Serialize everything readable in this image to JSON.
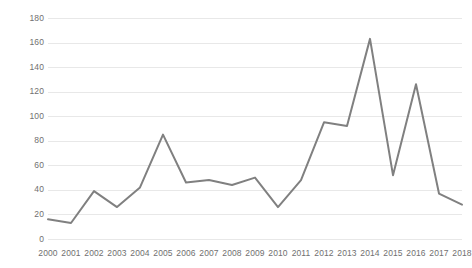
{
  "chart_data": {
    "type": "line",
    "title": "",
    "subtitle": "",
    "xlabel": "",
    "ylabel": "",
    "x": [
      2000,
      2001,
      2002,
      2003,
      2004,
      2005,
      2006,
      2007,
      2008,
      2009,
      2010,
      2011,
      2012,
      2013,
      2014,
      2015,
      2016,
      2017,
      2018
    ],
    "categories": [
      "2000",
      "2001",
      "2002",
      "2003",
      "2004",
      "2005",
      "2006",
      "2007",
      "2008",
      "2009",
      "2010",
      "2011",
      "2012",
      "2013",
      "2014",
      "2015",
      "2016",
      "2017",
      "2018"
    ],
    "values": [
      16,
      13,
      39,
      26,
      42,
      85,
      46,
      48,
      44,
      50,
      26,
      48,
      95,
      92,
      163,
      52,
      126,
      37,
      28
    ],
    "series": [
      {
        "name": "",
        "color": "#808080",
        "values": [
          16,
          13,
          39,
          26,
          42,
          85,
          46,
          48,
          44,
          50,
          26,
          48,
          95,
          92,
          163,
          52,
          126,
          37,
          28
        ]
      }
    ],
    "ylim": [
      0,
      180
    ],
    "ytick_values": [
      0,
      20,
      40,
      60,
      80,
      100,
      120,
      140,
      160,
      180
    ],
    "ytick_labels": [
      "0",
      "20",
      "40",
      "60",
      "80",
      "100",
      "120",
      "140",
      "160",
      "180"
    ],
    "xtick_labels": [
      "2000",
      "2001",
      "2002",
      "2003",
      "2004",
      "2005",
      "2006",
      "2007",
      "2008",
      "2009",
      "2010",
      "2011",
      "2012",
      "2013",
      "2014",
      "2015",
      "2016",
      "2017",
      "2018"
    ],
    "grid": true,
    "grid_axis": "y",
    "grid_color": "#e8e8e8",
    "legend": false,
    "legend_position": "none",
    "markers": false,
    "line_width": 2,
    "background_color": "#ffffff",
    "axis_label_color": "#707070"
  }
}
